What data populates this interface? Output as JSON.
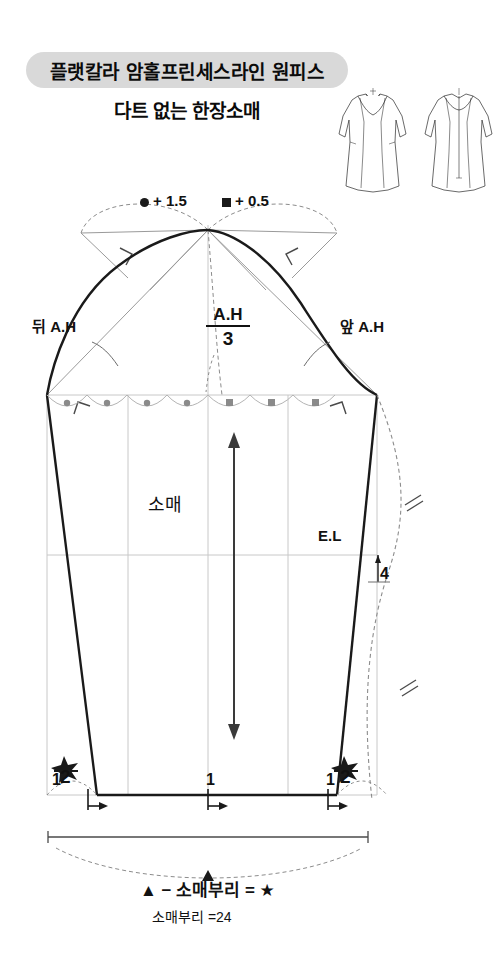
{
  "title": {
    "main": "플랫칼라  암홀프린세스라인  원피스",
    "sub": "다트 없는 한장소매",
    "banner_color": "#d9d9d9"
  },
  "technical_flats": {
    "front_view": "dress-front-flat-collar",
    "back_view": "dress-back-center-zipper"
  },
  "legend": {
    "circle_note": "+ 1.5",
    "square_note": "+ 0.5",
    "circle_symbol": "circle-marker",
    "square_symbol": "square-marker",
    "circle_count": 4,
    "square_count": 3
  },
  "annotations": {
    "back_armhole": "뒤 A.H",
    "front_armhole": "앞 A.H",
    "cap_height_num": "A.H",
    "cap_height_den": "3",
    "piece_name": "소매",
    "elbow_line": "E.L",
    "elbow_offset": "4",
    "hem_star_num": "★",
    "hem_star_den": "2",
    "hem_step_left": "1",
    "hem_step_center": "1",
    "hem_step_right": "1"
  },
  "footer": {
    "formula": "▲ − 소매부리 = ★",
    "measurement": "소매부리 =24",
    "triangle_symbol": "triangle-marker"
  },
  "colors": {
    "outline": "#1a1a1a",
    "construction": "#9a9a9a",
    "guide": "#c8c8c8",
    "dashed": "#8c8c8c"
  }
}
